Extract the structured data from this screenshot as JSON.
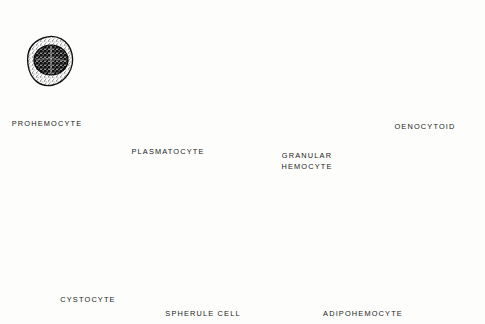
{
  "figure": {
    "background_color": "#fdfdfc",
    "ink_color": "#1a1a1a",
    "style": "pen-and-ink stipple line drawing"
  },
  "cells": [
    {
      "id": "prohemocyte",
      "label": "PROHEMOCYTE",
      "label_lines": [
        "PROHEMOCYTE"
      ],
      "row": 1,
      "column": 1,
      "label_x": 47,
      "label_y": 119,
      "shape": "small rounded oval",
      "cytoplasm": "thin stippled rim",
      "nucleus": "large dark round nucleus filling most of cell"
    },
    {
      "id": "plasmatocyte",
      "label": "PLASMATOCYTE",
      "label_lines": [
        "PLASMATOCYTE"
      ],
      "row": 1,
      "column": 2,
      "label_x": 168,
      "label_y": 147,
      "shape": "large amoeboid with spiky filopodia",
      "cytoplasm": "finely stippled",
      "nucleus": "round pale nucleus, right of centre"
    },
    {
      "id": "granular-hemocyte",
      "label": "GRANULAR HEMOCYTE",
      "label_lines": [
        "GRANULAR",
        "HEMOCYTE"
      ],
      "row": 1,
      "column": 3,
      "label_x": 307,
      "label_y": 150,
      "shape": "elongated bullet / tombstone with pointed apex",
      "cytoplasm": "dense dark granules",
      "nucleus": "pale oval nucleus near top"
    },
    {
      "id": "oenocytoid",
      "label": "OENOCYTOID",
      "label_lines": [
        "OENOCYTOID"
      ],
      "row": 1,
      "column": 4,
      "label_x": 425,
      "label_y": 122,
      "shape": "rounded oval",
      "cytoplasm": "stippled with dark crack-like striations",
      "nucleus": "dark kidney-shaped nucleus, centre"
    },
    {
      "id": "cystocyte",
      "label": "CYSTOCYTE",
      "label_lines": [
        "CYSTOCYTE"
      ],
      "row": 2,
      "column": 1,
      "label_x": 88,
      "label_y": 295,
      "shape": "triangular teardrop",
      "cytoplasm": "stippled with scattered dark rod granules",
      "nucleus": "small dark round nucleus, centre"
    },
    {
      "id": "spherule-cell",
      "label": "SPHERULE  CELL",
      "label_lines": [
        "SPHERULE  CELL"
      ],
      "row": 2,
      "column": 2,
      "label_x": 203,
      "label_y": 309,
      "shape": "round",
      "cytoplasm": "packed with many clear spherules of varying size",
      "nucleus": "pale oval nucleus, centre"
    },
    {
      "id": "adipohemocyte",
      "label": "ADIPOHEMOCYTE",
      "label_lines": [
        "ADIPOHEMOCYTE"
      ],
      "row": 2,
      "column": 3,
      "label_x": 363,
      "label_y": 309,
      "shape": "irregular lobed mass",
      "cytoplasm": "stippled with numerous clear lipid droplets",
      "nucleus": "not distinct"
    }
  ]
}
